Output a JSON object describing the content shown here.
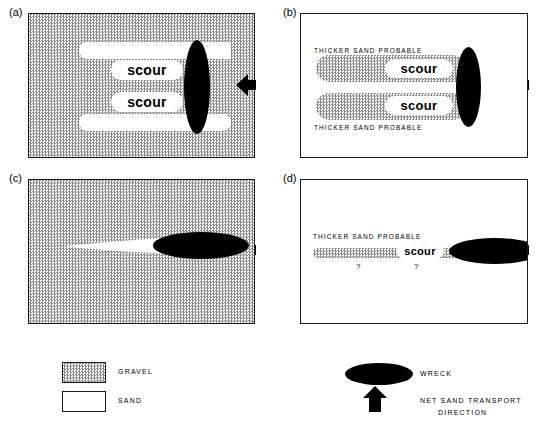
{
  "figure": {
    "background_color": "#ffffff",
    "ink_color": "#000000",
    "gravel_tone": "#8a8a8a"
  },
  "panels": [
    {
      "id": "a",
      "label": "(a)",
      "background": "gravel",
      "description": "Wreck on gravel with two white sand scour lobes trailing downstream",
      "scour_labels": [
        "scour",
        "scour"
      ],
      "wreck_orientation": "vertical",
      "arrow_label": "net sand transport direction"
    },
    {
      "id": "b",
      "label": "(b)",
      "background": "sand",
      "description": "Wreck with two gravel scour lobes and dashed thicker-sand envelope",
      "scour_labels": [
        "scour",
        "scour"
      ],
      "annotations": [
        "THICKER  SAND  PROBABLE",
        "THICKER  SAND  PROBABLE"
      ],
      "wreck_orientation": "vertical",
      "arrow_label": "net sand transport direction"
    },
    {
      "id": "c",
      "label": "(c)",
      "background": "gravel",
      "description": "Wreck on gravel with single tapering white sand streak",
      "scour_labels": [],
      "wreck_orientation": "horizontal",
      "arrow_label": "net sand transport direction"
    },
    {
      "id": "d",
      "label": "(d)",
      "background": "sand",
      "description": "Wreck with thin gravel scour band, thicker sand probable and queried limits",
      "scour_labels": [
        "scour"
      ],
      "annotations": [
        "THICKER  SAND  PROBABLE"
      ],
      "queries": [
        "?",
        "?"
      ],
      "wreck_orientation": "horizontal",
      "arrow_label": "net sand transport direction"
    }
  ],
  "legend": {
    "left": {
      "items": [
        {
          "swatch": "gravel",
          "label": "GRAVEL"
        },
        {
          "swatch": "sand",
          "label": "SAND"
        }
      ]
    },
    "right": {
      "items": [
        {
          "symbol": "black-ellipse",
          "label": "WRECK"
        },
        {
          "symbol": "left-arrow",
          "label_line1": "NET  SAND  TRANSPORT",
          "label_line2": "DIRECTION"
        }
      ]
    }
  }
}
